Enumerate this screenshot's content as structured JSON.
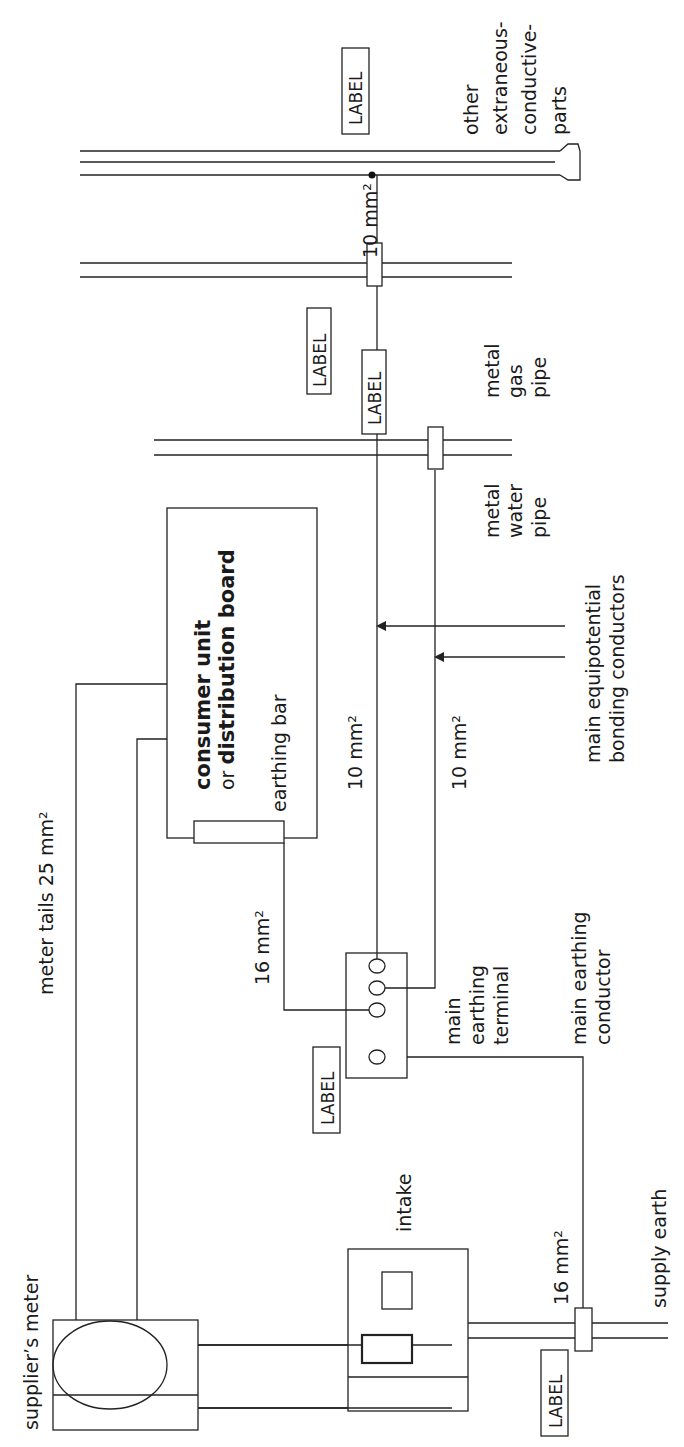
{
  "diagram": {
    "orientation": "rotated 90deg counter-clockwise",
    "labels": {
      "suppliers_meter": "supplier’s meter",
      "meter_tails": "meter tails 25 mm²",
      "intake": "intake",
      "supply_earth": "supply earth",
      "mec_size": "16 mm²",
      "met_cu_size": "16 mm²",
      "main_earthing_terminal_1": "main",
      "main_earthing_terminal_2": "earthing",
      "main_earthing_terminal_3": "terminal",
      "main_earthing_conductor_1": "main earthing",
      "main_earthing_conductor_2": "conductor",
      "consumer_unit_bold": "consumer unit",
      "or_word": "or ",
      "distribution_board_bold": "distribution board",
      "earthing_bar": "earthing bar",
      "bond1_size": "10 mm²",
      "bond2_size": "10 mm²",
      "bond3_size": "10 mm²",
      "bonding_1": "main equipotential",
      "bonding_2": "bonding conductors",
      "water_1": "metal",
      "water_2": "water",
      "water_3": "pipe",
      "gas_1": "metal",
      "gas_2": "gas",
      "gas_3": "pipe",
      "other_1": "other",
      "other_2": "extraneous-",
      "other_3": "conductive-",
      "other_4": "parts",
      "label_tag": "LABEL"
    }
  }
}
